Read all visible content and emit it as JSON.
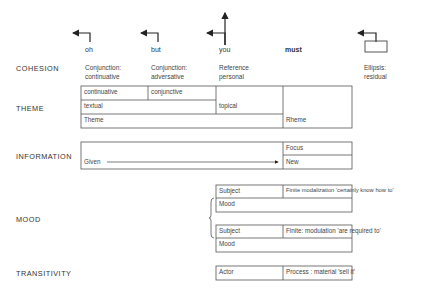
{
  "rows": {
    "cohesion": "COHESION",
    "theme": "THEME",
    "information": "INFORMATION",
    "mood": "MOOD",
    "transitivity": "TRANSITIVITY"
  },
  "words": [
    "oh",
    "but",
    "you",
    "must"
  ],
  "cohesion": {
    "oh": [
      "Conjunction:",
      "continuative"
    ],
    "but": [
      "Conjunction:",
      "adversative"
    ],
    "you": [
      "Reference",
      "personal"
    ],
    "ellipsis": [
      "Ellipsis:",
      "residual"
    ]
  },
  "theme": {
    "row1": [
      "continuative",
      "conjunctive"
    ],
    "textual": "textual",
    "topical": "topical",
    "theme": "Theme",
    "rheme": "Rheme"
  },
  "information": {
    "focus": "Focus",
    "given": "Given",
    "new": "New"
  },
  "mood": [
    {
      "subject": "Subject",
      "finite": "Finite modalization 'certainly know how to'",
      "mood": "Mood"
    },
    {
      "subject": "Subject",
      "finite": "Finite: modulation 'are required to'",
      "mood": "Mood"
    }
  ],
  "transitivity": {
    "actor": "Actor",
    "process": "Process : material 'sell it'"
  }
}
